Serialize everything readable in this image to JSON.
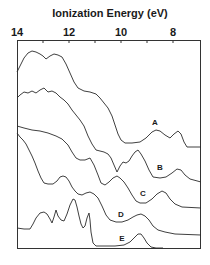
{
  "chart_data": {
    "type": "line",
    "title": "Ionization Energy (eV)",
    "xlabel": "Ionization Energy (eV)",
    "ylabel": "",
    "x_axis_position": "top",
    "x_reversed": true,
    "xlim": [
      14,
      7.1
    ],
    "x_ticks": [
      14,
      13,
      12,
      11,
      10,
      9,
      8
    ],
    "x_tick_labels": [
      "14",
      "12",
      "10",
      "8"
    ],
    "grid": false,
    "legend": "inline curve labels",
    "series": [
      {
        "name": "A",
        "label_pos": [
          155,
          122
        ],
        "points": [
          [
            17,
            72
          ],
          [
            20,
            66
          ],
          [
            24,
            58
          ],
          [
            28,
            53
          ],
          [
            32,
            51
          ],
          [
            36,
            52
          ],
          [
            40,
            54
          ],
          [
            43,
            56
          ],
          [
            46,
            59
          ],
          [
            50,
            56
          ],
          [
            54,
            54
          ],
          [
            58,
            55
          ],
          [
            62,
            57
          ],
          [
            66,
            64
          ],
          [
            70,
            73
          ],
          [
            74,
            82
          ],
          [
            78,
            88
          ],
          [
            84,
            91
          ],
          [
            90,
            92
          ],
          [
            96,
            94
          ],
          [
            100,
            98
          ],
          [
            104,
            103
          ],
          [
            108,
            108
          ],
          [
            112,
            116
          ],
          [
            115,
            125
          ],
          [
            118,
            134
          ],
          [
            121,
            140
          ],
          [
            125,
            143
          ],
          [
            132,
            143
          ],
          [
            140,
            142
          ],
          [
            146,
            138
          ],
          [
            152,
            132
          ],
          [
            156,
            130
          ],
          [
            160,
            131
          ],
          [
            165,
            135
          ],
          [
            170,
            138
          ],
          [
            174,
            134
          ],
          [
            178,
            131
          ],
          [
            181,
            134
          ],
          [
            184,
            142
          ],
          [
            187,
            147
          ],
          [
            201,
            147
          ]
        ]
      },
      {
        "name": "B",
        "label_pos": [
          160,
          167
        ],
        "points": [
          [
            17,
            98
          ],
          [
            20,
            95
          ],
          [
            24,
            92
          ],
          [
            28,
            93
          ],
          [
            32,
            91
          ],
          [
            36,
            93
          ],
          [
            40,
            90
          ],
          [
            44,
            88
          ],
          [
            48,
            92
          ],
          [
            52,
            91
          ],
          [
            56,
            93
          ],
          [
            60,
            97
          ],
          [
            64,
            100
          ],
          [
            68,
            104
          ],
          [
            72,
            110
          ],
          [
            76,
            115
          ],
          [
            80,
            120
          ],
          [
            84,
            126
          ],
          [
            88,
            136
          ],
          [
            92,
            144
          ],
          [
            96,
            150
          ],
          [
            100,
            151
          ],
          [
            104,
            152
          ],
          [
            108,
            154
          ],
          [
            111,
            158
          ],
          [
            114,
            165
          ],
          [
            117,
            172
          ],
          [
            120,
            166
          ],
          [
            123,
            162
          ],
          [
            126,
            163
          ],
          [
            129,
            161
          ],
          [
            132,
            156
          ],
          [
            135,
            152
          ],
          [
            138,
            150
          ],
          [
            141,
            154
          ],
          [
            145,
            161
          ],
          [
            149,
            170
          ],
          [
            153,
            177
          ],
          [
            160,
            178
          ],
          [
            166,
            177
          ],
          [
            172,
            173
          ],
          [
            177,
            169
          ],
          [
            181,
            170
          ],
          [
            185,
            175
          ],
          [
            190,
            179
          ],
          [
            201,
            182
          ]
        ]
      },
      {
        "name": "C",
        "label_pos": [
          143,
          193
        ],
        "points": [
          [
            17,
            126
          ],
          [
            24,
            128
          ],
          [
            32,
            130
          ],
          [
            40,
            131
          ],
          [
            48,
            133
          ],
          [
            56,
            136
          ],
          [
            62,
            139
          ],
          [
            68,
            145
          ],
          [
            72,
            152
          ],
          [
            76,
            158
          ],
          [
            80,
            160
          ],
          [
            85,
            160
          ],
          [
            90,
            158
          ],
          [
            94,
            165
          ],
          [
            98,
            175
          ],
          [
            101,
            183
          ],
          [
            105,
            185
          ],
          [
            109,
            182
          ],
          [
            113,
            178
          ],
          [
            117,
            176
          ],
          [
            120,
            178
          ],
          [
            124,
            182
          ],
          [
            128,
            188
          ],
          [
            132,
            195
          ],
          [
            136,
            201
          ],
          [
            140,
            203
          ],
          [
            146,
            203
          ],
          [
            152,
            199
          ],
          [
            157,
            194
          ],
          [
            162,
            191
          ],
          [
            166,
            193
          ],
          [
            170,
            199
          ],
          [
            175,
            204
          ],
          [
            182,
            207
          ],
          [
            201,
            208
          ]
        ]
      },
      {
        "name": "D",
        "label_pos": [
          121,
          214
        ],
        "points": [
          [
            17,
            133
          ],
          [
            20,
            137
          ],
          [
            23,
            140
          ],
          [
            26,
            144
          ],
          [
            29,
            150
          ],
          [
            32,
            156
          ],
          [
            35,
            163
          ],
          [
            38,
            171
          ],
          [
            41,
            178
          ],
          [
            44,
            183
          ],
          [
            48,
            184
          ],
          [
            53,
            184
          ],
          [
            57,
            181
          ],
          [
            60,
            177
          ],
          [
            63,
            176
          ],
          [
            66,
            177
          ],
          [
            69,
            181
          ],
          [
            72,
            187
          ],
          [
            75,
            191
          ],
          [
            78,
            194
          ],
          [
            82,
            195
          ],
          [
            86,
            193
          ],
          [
            90,
            192
          ],
          [
            94,
            194
          ],
          [
            98,
            198
          ],
          [
            102,
            206
          ],
          [
            106,
            215
          ],
          [
            110,
            220
          ],
          [
            116,
            222
          ],
          [
            122,
            222
          ],
          [
            128,
            220
          ],
          [
            133,
            217
          ],
          [
            137,
            215
          ],
          [
            141,
            214
          ],
          [
            145,
            216
          ],
          [
            149,
            220
          ],
          [
            153,
            226
          ],
          [
            158,
            230
          ],
          [
            165,
            232
          ],
          [
            175,
            234
          ],
          [
            201,
            235
          ]
        ]
      },
      {
        "name": "E",
        "label_pos": [
          122,
          238
        ],
        "points": [
          [
            17,
            228
          ],
          [
            24,
            229
          ],
          [
            30,
            229
          ],
          [
            33,
            224
          ],
          [
            36,
            218
          ],
          [
            40,
            213
          ],
          [
            44,
            212
          ],
          [
            47,
            214
          ],
          [
            50,
            219
          ],
          [
            52,
            223
          ],
          [
            54,
            217
          ],
          [
            56,
            210
          ],
          [
            58,
            216
          ],
          [
            61,
            220
          ],
          [
            64,
            221
          ],
          [
            67,
            214
          ],
          [
            70,
            205
          ],
          [
            73,
            199
          ],
          [
            75,
            200
          ],
          [
            77,
            207
          ],
          [
            79,
            216
          ],
          [
            81,
            224
          ],
          [
            83,
            228
          ],
          [
            85,
            226
          ],
          [
            87,
            218
          ],
          [
            89,
            213
          ],
          [
            90,
            220
          ],
          [
            91,
            232
          ],
          [
            93,
            243
          ],
          [
            96,
            246
          ],
          [
            104,
            246
          ],
          [
            115,
            246
          ],
          [
            124,
            245
          ],
          [
            130,
            242
          ],
          [
            134,
            238
          ],
          [
            138,
            234
          ],
          [
            141,
            234
          ],
          [
            144,
            238
          ],
          [
            147,
            243
          ],
          [
            151,
            247
          ],
          [
            156,
            248
          ],
          [
            163,
            248
          ]
        ]
      }
    ]
  },
  "axis": {
    "title": "Ionization Energy (eV)",
    "tick_labels": [
      {
        "text": "14",
        "x": 17
      },
      {
        "text": "12",
        "x": 69
      },
      {
        "text": "10",
        "x": 121
      },
      {
        "text": "8",
        "x": 173
      }
    ]
  },
  "labels": {
    "A": "A",
    "B": "B",
    "C": "C",
    "D": "D",
    "E": "E"
  },
  "colors": {
    "line": "#2a2a2a",
    "frame": "#333333",
    "background": "#ffffff"
  }
}
